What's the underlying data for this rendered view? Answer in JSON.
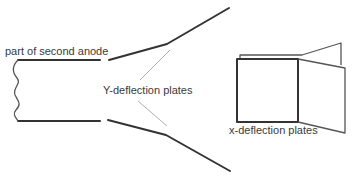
{
  "diagram": {
    "labels": {
      "anode": "part of second anode",
      "y_plates": "Y-deflection plates",
      "x_plates": "x-deflection plates"
    },
    "colors": {
      "line": "#333333",
      "leader": "#9a9a9a",
      "text": "#3a3a3a",
      "background": "#ffffff"
    }
  }
}
